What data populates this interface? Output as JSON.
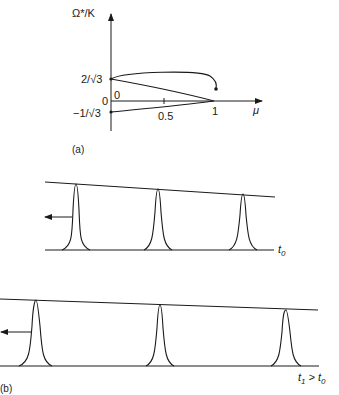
{
  "panel_a": {
    "caption": "(a)",
    "y_axis_label": "Ω*/K",
    "x_axis_label": "μ",
    "y_ticks": [
      {
        "label": "2/√3",
        "value": 1.1547
      },
      {
        "label": "0",
        "value": 0
      },
      {
        "label": "−1/√3",
        "value": -0.5774
      }
    ],
    "x_ticks": [
      {
        "label": "0",
        "value": 0
      },
      {
        "label": "0.5",
        "value": 0.5
      },
      {
        "label": "1",
        "value": 1
      }
    ],
    "curve_description": "S-shaped loop starting at μ=0, Ω*/K=−1/√3, turning at μ=1, Ω*/K=0, back to μ=0 at 2/√3, then looping toward μ≈1 ending with a dot"
  },
  "panel_b": {
    "caption": "(b)",
    "snapshots": [
      {
        "time_label": "t",
        "time_sub": "0",
        "time_suffix": "",
        "peaks": 3
      },
      {
        "time_label": "t",
        "time_sub": "1",
        "time_suffix": " > t",
        "time_suffix_sub": "0",
        "peaks": 3
      }
    ]
  }
}
